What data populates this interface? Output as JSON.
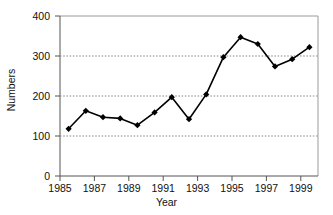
{
  "chart_data": {
    "type": "line",
    "title": "",
    "xlabel": "Year",
    "ylabel": "Numbers",
    "xlim": [
      1985,
      2000
    ],
    "ylim": [
      0,
      400
    ],
    "grid": true,
    "legend": false,
    "marker": "filled-diamond",
    "line_color": "#000000",
    "marker_color": "#000000",
    "gridline_color": "#999999",
    "axis_color": "#808080",
    "x": [
      1985.5,
      1986.5,
      1987.5,
      1988.5,
      1989.5,
      1990.5,
      1991.5,
      1992.5,
      1993.5,
      1994.5,
      1995.5,
      1996.5,
      1997.5,
      1998.5,
      1999.5
    ],
    "values": [
      118,
      163,
      147,
      144,
      127,
      159,
      197,
      142,
      204,
      297,
      347,
      330,
      274,
      292,
      322
    ],
    "xticks": [
      1985,
      1986,
      1987,
      1988,
      1989,
      1990,
      1991,
      1992,
      1993,
      1994,
      1995,
      1996,
      1997,
      1998,
      1999,
      2000
    ],
    "xtick_labels": [
      "1985",
      "",
      "1987",
      "",
      "1989",
      "",
      "1991",
      "",
      "1993",
      "",
      "1995",
      "",
      "1997",
      "",
      "1999",
      ""
    ],
    "xtick_labels_shown": [
      "1985",
      "1987",
      "1989",
      "1991",
      "1993",
      "1995",
      "1997",
      "1999"
    ],
    "yticks": [
      0,
      100,
      200,
      300,
      400
    ],
    "ytick_labels": [
      "0",
      "100",
      "200",
      "300",
      "400"
    ],
    "gridlines_at": [
      100,
      200,
      300
    ]
  }
}
